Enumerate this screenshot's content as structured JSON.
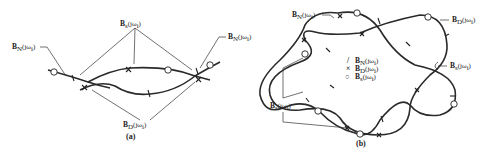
{
  "panel_a": {
    "caption": "(a)",
    "labels": {
      "bn_left": "B",
      "bn_left_sub": "N",
      "bn_left_arg": "(jω",
      "bn_left_i": "i",
      "bs_top": "B",
      "bs_top_sub": "s",
      "bs_top_arg": "(jω",
      "bs_top_i": "i",
      "bn_right": "B",
      "bn_right_sub": "N",
      "bn_right_arg": "(jω",
      "bn_right_i": "i",
      "bd_bottom": "B",
      "bd_bottom_sub": "D",
      "bd_bottom_arg": "(jω",
      "bd_bottom_i": "i"
    }
  },
  "panel_b": {
    "caption": "(b)",
    "labels": {
      "bn_top": "B",
      "bn_top_sub": "N",
      "bn_top_arg": "(jω",
      "bn_top_i": "i",
      "bd_right": "B",
      "bd_right_sub": "D",
      "bd_right_arg": "(jω",
      "bd_right_i": "i",
      "bs_right": "B",
      "bs_right_sub": "s",
      "bs_right_arg": "(jω",
      "bs_right_i": "i",
      "bs_left": "B",
      "bs_left_sub": "s",
      "bs_left_arg": "(jω",
      "bs_left_i": "i"
    },
    "legend": [
      {
        "symbol": "/",
        "label": "B",
        "sub": "N",
        "arg": "(jω",
        "i": "i"
      },
      {
        "symbol": "×",
        "label": "B",
        "sub": "D",
        "arg": "(jω",
        "i": "i"
      },
      {
        "symbol": "○",
        "label": "B",
        "sub": "s",
        "arg": "(jω",
        "i": "i"
      }
    ]
  }
}
